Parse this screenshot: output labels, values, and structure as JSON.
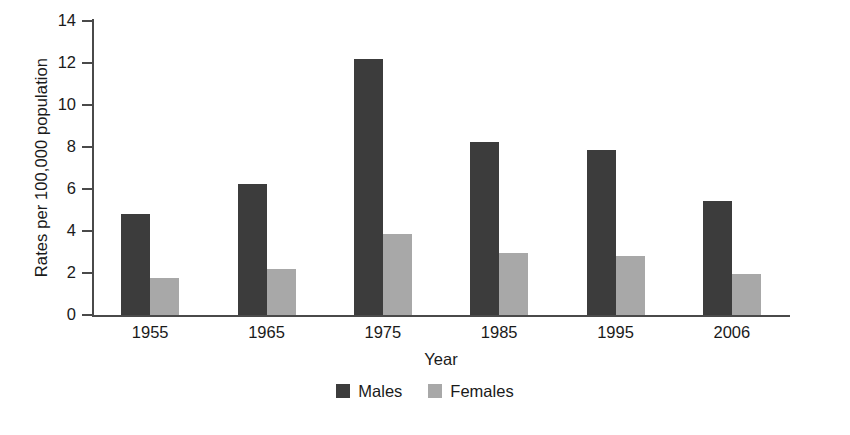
{
  "chart_data": {
    "type": "bar",
    "title": "",
    "xlabel": "Year",
    "ylabel": "Rates per 100,000 population",
    "categories": [
      "1955",
      "1965",
      "1975",
      "1985",
      "1995",
      "2006"
    ],
    "series": [
      {
        "name": "Males",
        "color": "#3c3c3c",
        "values": [
          4.8,
          6.25,
          12.2,
          8.25,
          7.85,
          5.45
        ]
      },
      {
        "name": "Females",
        "color": "#a8a8a8",
        "values": [
          1.75,
          2.2,
          3.85,
          2.95,
          2.8,
          1.95
        ]
      }
    ],
    "ylim": [
      0,
      14
    ],
    "yticks": [
      0,
      2,
      4,
      6,
      8,
      10,
      12,
      14
    ],
    "ytick_labels": [
      "0",
      "2",
      "4",
      "6",
      "8",
      "10",
      "12",
      "14"
    ],
    "grid": false,
    "legend_position": "bottom",
    "axis_color": "#4a4a4a",
    "background": "#ffffff"
  }
}
